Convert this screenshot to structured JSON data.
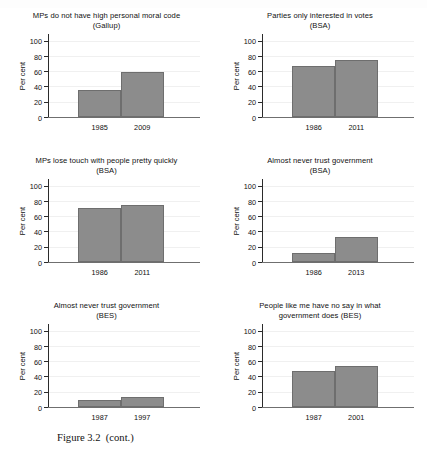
{
  "page": {
    "caption": "Figure 3.2  (cont.)",
    "background_color": "#ffffff",
    "bar_color": "#8c8c8c",
    "axis_color": "#2b2b2b"
  },
  "chart_data": [
    {
      "type": "bar",
      "panel": "top-left",
      "title": "MPs do not have high personal moral code",
      "subtitle": "(Gallup)",
      "categories": [
        "1985",
        "2009"
      ],
      "values": [
        36,
        59
      ],
      "xlabel": "",
      "ylabel": "Per cent",
      "ylim": [
        0,
        110
      ],
      "yticks": [
        0,
        20,
        40,
        60,
        80,
        100
      ],
      "grid": true,
      "legend": "none"
    },
    {
      "type": "bar",
      "panel": "top-right",
      "title": "Parties only interested in votes",
      "subtitle": "(BSA)",
      "categories": [
        "1986",
        "2011"
      ],
      "values": [
        68,
        76
      ],
      "xlabel": "",
      "ylabel": "Per cent",
      "ylim": [
        0,
        110
      ],
      "yticks": [
        0,
        20,
        40,
        60,
        80,
        100
      ],
      "grid": true,
      "legend": "none"
    },
    {
      "type": "bar",
      "panel": "middle-left",
      "title": "MPs lose touch with people pretty quickly",
      "subtitle": "(BSA)",
      "categories": [
        "1986",
        "2011"
      ],
      "values": [
        72,
        75
      ],
      "xlabel": "",
      "ylabel": "Per cent",
      "ylim": [
        0,
        110
      ],
      "yticks": [
        0,
        20,
        40,
        60,
        80,
        100
      ],
      "grid": true,
      "legend": "none"
    },
    {
      "type": "bar",
      "panel": "middle-right",
      "title": "Almost never trust government",
      "subtitle": "(BSA)",
      "categories": [
        "1986",
        "2013"
      ],
      "values": [
        12,
        33
      ],
      "xlabel": "",
      "ylabel": "Per cent",
      "ylim": [
        0,
        110
      ],
      "yticks": [
        0,
        20,
        40,
        60,
        80,
        100
      ],
      "grid": true,
      "legend": "none"
    },
    {
      "type": "bar",
      "panel": "bottom-left",
      "title": "Almost never trust government",
      "subtitle": "(BES)",
      "categories": [
        "1987",
        "1997"
      ],
      "values": [
        9,
        13
      ],
      "xlabel": "",
      "ylabel": "Per cent",
      "ylim": [
        0,
        110
      ],
      "yticks": [
        0,
        20,
        40,
        60,
        80,
        100
      ],
      "grid": true,
      "legend": "none"
    },
    {
      "type": "bar",
      "panel": "bottom-right",
      "title": "People like me have no say in what",
      "subtitle": "government does (BES)",
      "categories": [
        "1987",
        "2001"
      ],
      "values": [
        48,
        54
      ],
      "xlabel": "",
      "ylabel": "Per cent",
      "ylim": [
        0,
        110
      ],
      "yticks": [
        0,
        20,
        40,
        60,
        80,
        100
      ],
      "grid": true,
      "legend": "none"
    }
  ]
}
